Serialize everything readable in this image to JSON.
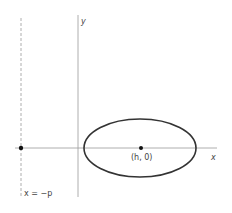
{
  "diagram": {
    "axes": {
      "x_label": "x",
      "y_label": "y"
    },
    "ellipse": {
      "center_label": "(h, 0)"
    },
    "directrix": {
      "label": "x = −p"
    },
    "colors": {
      "axis": "#9a9a9a",
      "curve": "#333333",
      "point": "#111111"
    }
  }
}
